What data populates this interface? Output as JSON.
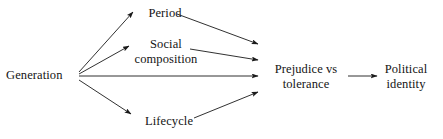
{
  "diagram": {
    "type": "flow-diagram",
    "stroke_color": "#1a1a1a",
    "text_color": "#141414",
    "background_color": "#ffffff",
    "nodes": [
      {
        "id": "generation",
        "label_lines": [
          "Generation"
        ],
        "label": "Generation"
      },
      {
        "id": "period",
        "label_lines": [
          "Period"
        ],
        "label": "Period"
      },
      {
        "id": "social",
        "label_lines": [
          "Social",
          "composition"
        ],
        "label": "Social composition"
      },
      {
        "id": "lifecycle",
        "label_lines": [
          "Lifecycle"
        ],
        "label": "Lifecycle"
      },
      {
        "id": "prejudice",
        "label_lines": [
          "Prejudice vs",
          "tolerance"
        ],
        "label": "Prejudice vs tolerance"
      },
      {
        "id": "political",
        "label_lines": [
          "Political",
          "identity"
        ],
        "label": "Political identity"
      }
    ],
    "edges": [
      {
        "id": "generation-to-period",
        "from": "generation",
        "to": "period"
      },
      {
        "id": "generation-to-social",
        "from": "generation",
        "to": "social"
      },
      {
        "id": "generation-to-prejudice",
        "from": "generation",
        "to": "prejudice"
      },
      {
        "id": "generation-to-lifecycle",
        "from": "generation",
        "to": "lifecycle"
      },
      {
        "id": "period-to-prejudice",
        "from": "period",
        "to": "prejudice"
      },
      {
        "id": "social-to-prejudice",
        "from": "social",
        "to": "prejudice"
      },
      {
        "id": "lifecycle-to-prejudice",
        "from": "lifecycle",
        "to": "prejudice"
      },
      {
        "id": "prejudice-to-political",
        "from": "prejudice",
        "to": "political"
      }
    ]
  }
}
